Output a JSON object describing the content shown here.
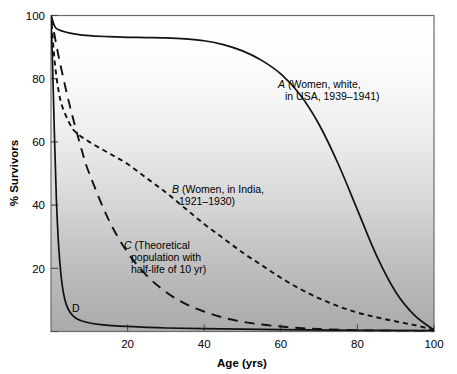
{
  "chart_data": {
    "type": "line",
    "title": "",
    "xlabel": "Age (yrs)",
    "ylabel": "% Survivors",
    "xlim": [
      0,
      100
    ],
    "ylim": [
      0,
      100
    ],
    "xticks": [
      "20",
      "40",
      "60",
      "80",
      "100"
    ],
    "xtick_values": [
      20,
      40,
      60,
      80,
      100
    ],
    "yticks": [
      "20",
      "40",
      "60",
      "80",
      "100"
    ],
    "ytick_values": [
      20,
      40,
      60,
      80,
      100
    ],
    "grid": false,
    "legend": "inline annotations",
    "background": "vertical gradient white (top) to gray (bottom)",
    "series": [
      {
        "name": "A",
        "label_series": "A",
        "label_lines": [
          "A (Women, white,",
          "in USA, 1939–1941)"
        ],
        "style": "solid",
        "x": [
          0,
          1,
          2,
          4,
          6,
          10,
          15,
          20,
          25,
          30,
          35,
          40,
          45,
          50,
          55,
          60,
          65,
          70,
          75,
          80,
          85,
          90,
          95,
          100
        ],
        "values": [
          100,
          96.5,
          95.5,
          94.7,
          94.2,
          93.6,
          93.3,
          93.1,
          93.0,
          92.9,
          92.6,
          92.0,
          90.8,
          88.8,
          85.8,
          81.5,
          75.0,
          65.5,
          53.0,
          38.5,
          24.0,
          12.5,
          5.0,
          0.5
        ]
      },
      {
        "name": "B",
        "label_series": "B",
        "label_lines": [
          "B (Women, in India,",
          "1921–1930)"
        ],
        "style": "short-dash",
        "x": [
          0,
          1,
          2,
          3,
          5,
          6.5,
          10,
          15,
          20,
          25,
          30,
          35,
          40,
          45,
          50,
          55,
          60,
          65,
          70,
          75,
          80,
          85,
          90,
          95,
          100
        ],
        "values": [
          100,
          85,
          76,
          71,
          65.5,
          63.0,
          60.0,
          56.5,
          53.0,
          48.5,
          44.0,
          39.0,
          34.0,
          29.5,
          25.0,
          21.0,
          17.0,
          13.5,
          10.5,
          8.0,
          6.0,
          4.5,
          3.2,
          2.0,
          0.5
        ]
      },
      {
        "name": "C",
        "label_series": "C",
        "label_lines": [
          "C (Theoretical",
          "population with",
          "half-life of 10 yr)"
        ],
        "style": "long-dash",
        "x": [
          0,
          2,
          5,
          8,
          10,
          15,
          20,
          25,
          30,
          35,
          40,
          45,
          50,
          55,
          60,
          65,
          70,
          80,
          90,
          100
        ],
        "values": [
          100,
          87,
          71,
          57.5,
          50,
          35.5,
          25,
          17.7,
          12.5,
          8.8,
          6.3,
          4.4,
          3.1,
          2.2,
          1.6,
          1.1,
          0.8,
          0.4,
          0.2,
          0.1
        ]
      },
      {
        "name": "D",
        "label_series": "D",
        "label_lines": [
          "D"
        ],
        "style": "solid",
        "x": [
          0,
          0.4,
          0.9,
          1.4,
          2.0,
          2.6,
          3.2,
          4.0,
          5.0,
          6.5,
          9,
          13,
          20,
          30,
          45,
          60,
          80,
          100
        ],
        "values": [
          100,
          85,
          62,
          42,
          27,
          18,
          12.5,
          8.5,
          6.0,
          4.2,
          3.0,
          2.2,
          1.6,
          1.1,
          0.8,
          0.6,
          0.4,
          0.3
        ]
      }
    ],
    "annotations": [
      {
        "id": "label-a",
        "lines": [
          "A (Women, white,",
          "in USA, 1939–1941)"
        ]
      },
      {
        "id": "label-b",
        "lines": [
          "B (Women, in India,",
          "1921–1930)"
        ]
      },
      {
        "id": "label-c",
        "lines": [
          "C (Theoretical",
          "population with",
          "half-life of 10 yr)"
        ]
      },
      {
        "id": "label-d",
        "lines": [
          "D"
        ]
      }
    ]
  },
  "axes": {
    "x_title": "Age (yrs)",
    "y_title": "% Survivors",
    "x_ticks": [
      "20",
      "40",
      "60",
      "80",
      "100"
    ],
    "y_ticks": [
      "20",
      "40",
      "60",
      "80",
      "100"
    ]
  },
  "labels": {
    "a_line1": "A (Women, white,",
    "a_line2": "in USA, 1939–1941)",
    "a_series": "A",
    "a_rest1": " (Women, white,",
    "b_series": "B",
    "b_rest1": " (Women, in India,",
    "b_line2": "1921–1930)",
    "c_series": "C",
    "c_rest1": " (Theoretical",
    "c_line2": "population with",
    "c_line3": "half-life of 10 yr)",
    "d_series": "D"
  },
  "colors": {
    "curve": "#111111",
    "frame": "#6b6b6b",
    "bg_top": "#ffffff",
    "bg_bottom": "#a9a9a9",
    "text": "#000000"
  }
}
